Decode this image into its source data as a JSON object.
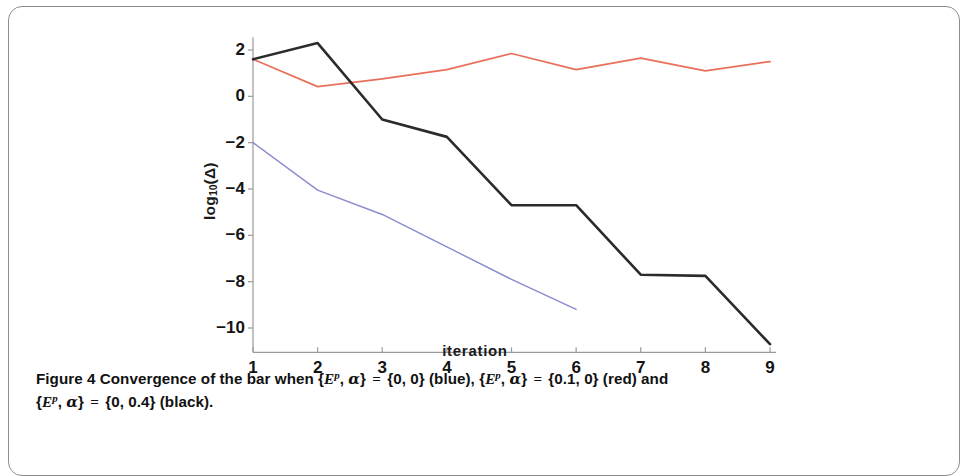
{
  "figure": {
    "caption_number": "Figure 4",
    "caption_line1_a": "Convergence of the bar when {",
    "caption_line1_var": "E",
    "caption_line1_sup": "p",
    "caption_line1_b": ", ",
    "caption_line1_greek": "α",
    "caption_line1_c": "} ",
    "caption_eq": "=",
    "caption_line1_d": " {0, 0} (blue), {",
    "caption_line1_e": "} ",
    "caption_line1_f": " {0.1, 0} (red) and",
    "caption_line2_a": "{",
    "caption_line2_b": "} ",
    "caption_line2_c": " {0, 0.4} (black).",
    "full_caption_text": "Figure 4 Convergence of the bar when {E^p, α} = {0, 0} (blue), {E^p, α} = {0.1, 0} (red) and {E^p, α} = {0, 0.4} (black)."
  },
  "chart_data": {
    "type": "line",
    "title": "",
    "xlabel": "iteration",
    "ylabel": "log10(Δ)",
    "ylabel_base": "log",
    "ylabel_sub": "10",
    "ylabel_arg": "(Δ)",
    "x": [
      1,
      2,
      3,
      4,
      5,
      6,
      7,
      8,
      9
    ],
    "xlim": [
      1,
      9
    ],
    "ylim": [
      -11.2,
      2.6
    ],
    "xticks": [
      1,
      2,
      3,
      4,
      5,
      6,
      7,
      8,
      9
    ],
    "xtick_labels": [
      "1",
      "2",
      "3",
      "4",
      "5",
      "6",
      "7",
      "8",
      "9"
    ],
    "yticks": [
      2,
      0,
      -2,
      -4,
      -6,
      -8,
      -10
    ],
    "ytick_labels": [
      "2",
      "0",
      "−2",
      "−4",
      "−6",
      "−8",
      "−10"
    ],
    "grid": false,
    "legend_position": "none",
    "series": [
      {
        "name": "{E^p, α} = {0, 0} (blue)",
        "color": "#8a8ad0",
        "width": 1.4,
        "x": [
          1,
          2,
          3,
          4,
          5,
          6
        ],
        "values": [
          -2.0,
          -4.05,
          -5.1,
          -6.5,
          -7.9,
          -9.2
        ]
      },
      {
        "name": "{E^p, α} = {0.1, 0} (red)",
        "color": "#e8705a",
        "width": 1.7,
        "x": [
          1,
          2,
          3,
          4,
          5,
          6,
          7,
          8,
          9
        ],
        "values": [
          1.6,
          0.42,
          0.75,
          1.15,
          1.85,
          1.15,
          1.65,
          1.1,
          1.5
        ]
      },
      {
        "name": "{E^p, α} = {0, 0.4} (black)",
        "color": "#2b2b2b",
        "width": 2.6,
        "x": [
          1,
          2,
          3,
          4,
          5,
          6,
          7,
          8,
          9
        ],
        "values": [
          1.6,
          2.3,
          -1.0,
          -1.75,
          -4.7,
          -4.7,
          -7.7,
          -7.75,
          -10.7
        ]
      }
    ],
    "axis_color": "#9a9a9a"
  }
}
